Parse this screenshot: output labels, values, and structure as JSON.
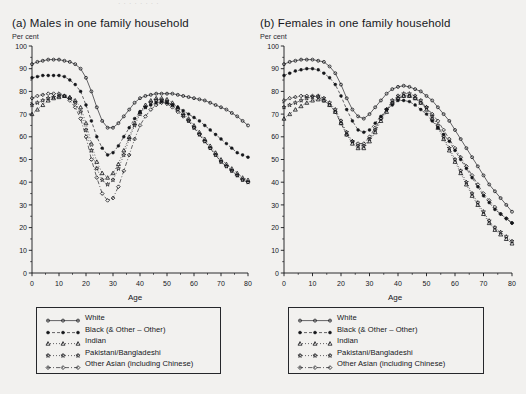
{
  "figure": {
    "top_remnant_text": "·  ·   ·      ·            · · · ·",
    "background_color": "#f2f1ef",
    "ink_color": "#15161a"
  },
  "panels": [
    {
      "id": "males",
      "title": "(a) Males in one family household",
      "y_unit": "Per cent",
      "x_axis_label": "Age"
    },
    {
      "id": "females",
      "title": "(b) Females in one family household",
      "y_unit": "Per cent",
      "x_axis_label": "Age"
    }
  ],
  "legend": {
    "items": [
      {
        "label": "White",
        "marker": "open-circle",
        "dash": "solid"
      },
      {
        "label": "Black (& Other – Other)",
        "marker": "filled-circle",
        "dash": "dash"
      },
      {
        "label": "Indian",
        "marker": "open-triangle",
        "dash": "dot"
      },
      {
        "label": "Pakistani/Bangladeshi",
        "marker": "star",
        "dash": "dot"
      },
      {
        "label": "Other Asian (including Chinese)",
        "marker": "open-diamond",
        "dash": "dash-dot"
      }
    ]
  },
  "chart_data": [
    {
      "type": "line",
      "id": "males",
      "title": "(a) Males in one family household",
      "xlabel": "Age",
      "ylabel": "Per cent",
      "xlim": [
        0,
        80
      ],
      "ylim": [
        0,
        100
      ],
      "xticks": [
        0,
        10,
        20,
        30,
        40,
        50,
        60,
        70,
        80
      ],
      "yticks": [
        0,
        10,
        20,
        30,
        40,
        50,
        60,
        70,
        80,
        90,
        100
      ],
      "grid": false,
      "legend_position": "below-plot",
      "x": [
        0,
        2,
        4,
        6,
        8,
        10,
        12,
        14,
        16,
        18,
        20,
        22,
        24,
        26,
        28,
        30,
        32,
        34,
        36,
        38,
        40,
        42,
        44,
        46,
        48,
        50,
        52,
        54,
        56,
        58,
        60,
        62,
        64,
        66,
        68,
        70,
        72,
        74,
        76,
        78,
        80
      ],
      "series": [
        {
          "name": "White",
          "marker": "open-circle",
          "values": [
            92,
            93,
            93.5,
            94,
            94,
            94,
            93.5,
            93,
            92,
            90,
            86,
            80,
            73,
            67,
            64,
            64,
            66,
            69,
            72,
            75,
            77,
            78,
            78.5,
            79,
            79,
            79,
            79,
            78.5,
            78,
            77.5,
            77,
            76.5,
            76,
            75,
            74,
            73,
            72,
            70.5,
            69,
            67,
            65
          ]
        },
        {
          "name": "Black (& Other – Other)",
          "marker": "filled-circle",
          "values": [
            86,
            86.5,
            87,
            87,
            87,
            87,
            86.5,
            85,
            83,
            80,
            74,
            67,
            60,
            55,
            52,
            53,
            56,
            60,
            64,
            68,
            71,
            73,
            74,
            75,
            75.5,
            75,
            74,
            73,
            71.5,
            70,
            68.5,
            67,
            65,
            63,
            61,
            59,
            57,
            55,
            53,
            52,
            51
          ]
        },
        {
          "name": "Indian",
          "marker": "open-triangle",
          "values": [
            70,
            72,
            74,
            76,
            77,
            77.5,
            78,
            77.5,
            76,
            73,
            66,
            57,
            49,
            44,
            42,
            44,
            48,
            54,
            60,
            66,
            71,
            74,
            76,
            77,
            77,
            76.5,
            75,
            73,
            70.5,
            68,
            65,
            62,
            59,
            56,
            53,
            50,
            48,
            46,
            44,
            42,
            41
          ]
        },
        {
          "name": "Pakistani/Bangladeshi",
          "marker": "star",
          "values": [
            74,
            75,
            76,
            77,
            77.5,
            78,
            78,
            77,
            75,
            71,
            63,
            54,
            46,
            41,
            39,
            41,
            46,
            52,
            59,
            65,
            70,
            73,
            75,
            76,
            76,
            75.5,
            74,
            72,
            69.5,
            67,
            64,
            61,
            58,
            55,
            52,
            49,
            47,
            45,
            43,
            41,
            40
          ]
        },
        {
          "name": "Other Asian (including Chinese)",
          "marker": "open-diamond",
          "values": [
            77,
            78,
            78.5,
            79,
            79,
            79,
            78,
            76,
            73,
            68,
            60,
            50,
            42,
            35,
            32,
            33,
            38,
            45,
            52,
            59,
            65,
            69,
            72,
            74,
            75,
            74.5,
            73,
            71,
            69,
            67,
            64,
            61,
            58,
            55,
            52,
            49,
            47,
            45,
            43,
            41,
            40
          ]
        }
      ]
    },
    {
      "type": "line",
      "id": "females",
      "title": "(b) Females in one family household",
      "xlabel": "Age",
      "ylabel": "Per cent",
      "xlim": [
        0,
        80
      ],
      "ylim": [
        0,
        100
      ],
      "xticks": [
        0,
        10,
        20,
        30,
        40,
        50,
        60,
        70,
        80
      ],
      "yticks": [
        0,
        10,
        20,
        30,
        40,
        50,
        60,
        70,
        80,
        90,
        100
      ],
      "grid": false,
      "legend_position": "below-plot",
      "x": [
        0,
        2,
        4,
        6,
        8,
        10,
        12,
        14,
        16,
        18,
        20,
        22,
        24,
        26,
        28,
        30,
        32,
        34,
        36,
        38,
        40,
        42,
        44,
        46,
        48,
        50,
        52,
        54,
        56,
        58,
        60,
        62,
        64,
        66,
        68,
        70,
        72,
        74,
        76,
        78,
        80
      ],
      "series": [
        {
          "name": "White",
          "marker": "open-circle",
          "values": [
            92,
            93,
            93.5,
            94,
            94,
            94,
            93.5,
            93,
            91,
            88,
            83,
            77,
            72,
            69,
            68,
            70,
            73,
            76,
            79,
            81,
            82,
            82.5,
            82,
            81,
            80,
            78,
            76,
            73,
            70,
            67,
            63,
            59,
            55,
            51,
            47,
            43,
            39,
            36,
            33,
            30,
            27
          ]
        },
        {
          "name": "Black (& Other – Other)",
          "marker": "filled-circle",
          "values": [
            87,
            88,
            89,
            89.5,
            90,
            90,
            89.5,
            88,
            86,
            83,
            78,
            72,
            67,
            63,
            62,
            63,
            66,
            69,
            72,
            74,
            76,
            76,
            75.5,
            74,
            72,
            70,
            67,
            64,
            61,
            58,
            54,
            50,
            46,
            42,
            38,
            34,
            31,
            28,
            26,
            24,
            22
          ]
        },
        {
          "name": "Indian",
          "marker": "open-triangle",
          "values": [
            68,
            70,
            72,
            73.5,
            75,
            76,
            76.5,
            76,
            74,
            71,
            66,
            61,
            57,
            55,
            55,
            58,
            62,
            67,
            71,
            75,
            77,
            78,
            78,
            77,
            75,
            72,
            68,
            64,
            59,
            54,
            49,
            44,
            39,
            34,
            30,
            26,
            22,
            19,
            17,
            15,
            13
          ]
        },
        {
          "name": "Pakistani/Bangladeshi",
          "marker": "star",
          "values": [
            73,
            74,
            75,
            76,
            77,
            77.5,
            78,
            77,
            75,
            72,
            67,
            62,
            58,
            56,
            56,
            59,
            63,
            68,
            72,
            76,
            78,
            79,
            79,
            78,
            76,
            73,
            69,
            65,
            60,
            55,
            50,
            45,
            40,
            35,
            31,
            27,
            23,
            20,
            18,
            16,
            14
          ]
        },
        {
          "name": "Other Asian (including Chinese)",
          "marker": "open-diamond",
          "values": [
            76,
            77,
            77.5,
            78,
            78,
            78,
            77.5,
            76,
            74,
            71,
            66,
            61,
            58,
            57,
            57,
            60,
            64,
            68,
            72,
            75,
            77,
            78,
            78,
            77,
            75,
            73,
            70,
            67,
            63,
            59,
            55,
            51,
            47,
            43,
            39,
            35,
            32,
            29,
            26,
            24,
            22
          ]
        }
      ]
    }
  ]
}
